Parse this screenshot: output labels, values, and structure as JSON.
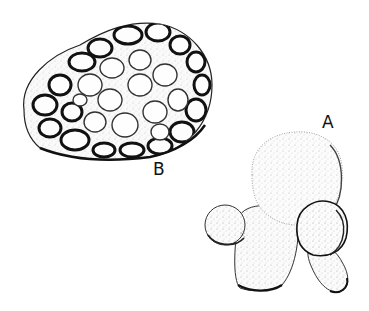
{
  "figure": {
    "type": "scientific pen-and-ink illustration",
    "colors": {
      "ink": "#111111",
      "paper": "#ffffff",
      "stipple": "#555555"
    },
    "specimens": [
      {
        "id": "B",
        "label": "B",
        "description": "oval specimen with reticulate surface of rounded cells separated by dark ridges"
      },
      {
        "id": "A",
        "label": "A",
        "description": "stippled specimen with large globular head, two smaller lateral globules and two stalk-like lobes"
      }
    ]
  }
}
